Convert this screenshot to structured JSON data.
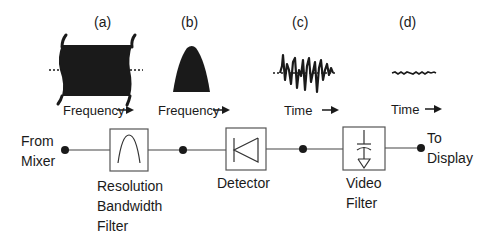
{
  "panels": [
    {
      "id": "a",
      "label": "(a)",
      "axis_label": "Frequency",
      "axis_arrow": "→",
      "waveform": "wideband-spectrum"
    },
    {
      "id": "b",
      "label": "(b)",
      "axis_label": "Frequency",
      "axis_arrow": "→",
      "waveform": "filtered-spectrum"
    },
    {
      "id": "c",
      "label": "(c)",
      "axis_label": "Time",
      "axis_arrow": "→",
      "waveform": "noisy-time-signal"
    },
    {
      "id": "d",
      "label": "(d)",
      "axis_label": "Time",
      "axis_arrow": "→",
      "waveform": "smoothed-time-signal"
    }
  ],
  "signal_chain": {
    "input": {
      "line1": "From",
      "line2": "Mixer"
    },
    "blocks": [
      {
        "id": "rbw",
        "line1": "Resolution",
        "line2": "Bandwidth",
        "line3": "Filter",
        "icon": "bandpass-filter-icon"
      },
      {
        "id": "detector",
        "line1": "Detector",
        "icon": "diode-icon"
      },
      {
        "id": "video",
        "line1": "Video",
        "line2": "Filter",
        "icon": "capacitor-ground-icon"
      }
    ],
    "output": {
      "line1": "To",
      "line2": "Display"
    }
  },
  "colors": {
    "ink": "#1a1a1a",
    "box": "#555555",
    "background": "#ffffff"
  }
}
